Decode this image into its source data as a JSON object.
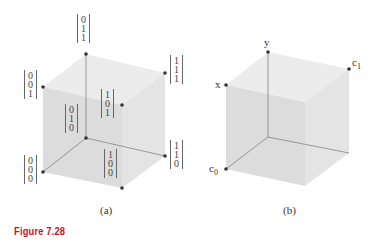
{
  "figure": {
    "caption": "Figure 7.28",
    "panel_a": {
      "label": "(a)",
      "vertices": [
        {
          "id": "v011",
          "vec": [
            "0",
            "1",
            "1"
          ]
        },
        {
          "id": "v001",
          "vec": [
            "0",
            "0",
            "1"
          ]
        },
        {
          "id": "v111",
          "vec": [
            "1",
            "1",
            "1"
          ]
        },
        {
          "id": "v101",
          "vec": [
            "1",
            "0",
            "1"
          ]
        },
        {
          "id": "v010",
          "vec": [
            "0",
            "1",
            "0"
          ]
        },
        {
          "id": "v000",
          "vec": [
            "0",
            "0",
            "0"
          ]
        },
        {
          "id": "v110",
          "vec": [
            "1",
            "1",
            "0"
          ]
        },
        {
          "id": "v100",
          "vec": [
            "1",
            "0",
            "0"
          ]
        }
      ]
    },
    "panel_b": {
      "label": "(b)",
      "vertex_labels": {
        "y": "y",
        "x": "x",
        "c1": "c",
        "c1_sub": "1",
        "c0": "c",
        "c0_sub": "0"
      }
    }
  }
}
